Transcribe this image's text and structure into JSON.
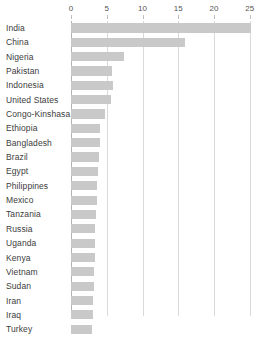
{
  "chart": {
    "type": "bar",
    "orientation": "horizontal",
    "bar_color": "#c9c9c9",
    "gridline_color": "#d9d9d9",
    "axis_color": "#b3b3b3",
    "label_color": "#3c3c3c"
  },
  "chart_data": {
    "type": "bar",
    "title": "",
    "subtitle": "",
    "xlabel": "",
    "ylabel": "",
    "xlim": [
      0,
      26
    ],
    "axis_position": "top",
    "grid": true,
    "legend": false,
    "ticks": [
      0,
      5,
      10,
      15,
      20,
      25
    ],
    "tick_labels": [
      "0",
      "5",
      "10",
      "15",
      "20",
      "25"
    ],
    "categories": [
      "India",
      "China",
      "Nigeria",
      "Pakistan",
      "Indonesia",
      "United States",
      "Congo-Kinshasa",
      "Ethiopia",
      "Bangladesh",
      "Brazil",
      "Egypt",
      "Philippines",
      "Mexico",
      "Tanzania",
      "Russia",
      "Uganda",
      "Kenya",
      "Vietnam",
      "Sudan",
      "Iran",
      "Iraq",
      "Turkey"
    ],
    "values": [
      25.1,
      16.0,
      7.4,
      5.7,
      5.9,
      5.6,
      4.7,
      4.1,
      4.0,
      3.9,
      3.8,
      3.7,
      3.6,
      3.5,
      3.4,
      3.3,
      3.3,
      3.2,
      3.2,
      3.1,
      3.1,
      3.0
    ]
  }
}
